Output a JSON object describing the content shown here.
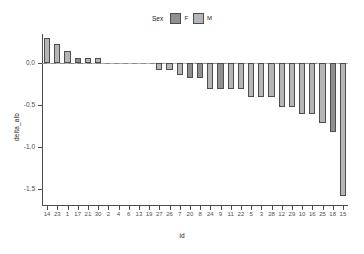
{
  "legend": {
    "title": "Sex",
    "items": [
      {
        "label": "F",
        "color": "#8f8f8f"
      },
      {
        "label": "M",
        "color": "#b5b5b5"
      }
    ]
  },
  "axes": {
    "x_title": "id",
    "y_title": "delta_alb",
    "y_ticks": [
      "0.0",
      "-0.5",
      "-1.0",
      "-1.5"
    ]
  },
  "chart_data": {
    "type": "bar",
    "title": "",
    "xlabel": "id",
    "ylabel": "delta_alb",
    "ylim": [
      -1.7,
      0.35
    ],
    "grid": false,
    "legend_position": "top",
    "legend_title": "Sex",
    "categories": [
      "14",
      "23",
      "1",
      "17",
      "21",
      "30",
      "2",
      "4",
      "6",
      "13",
      "19",
      "27",
      "26",
      "7",
      "20",
      "8",
      "24",
      "9",
      "11",
      "22",
      "5",
      "3",
      "28",
      "12",
      "29",
      "10",
      "16",
      "25",
      "18",
      "15"
    ],
    "values": [
      0.3,
      0.23,
      0.15,
      0.06,
      0.06,
      0.06,
      0.0,
      0.0,
      0.0,
      0.0,
      0.0,
      -0.08,
      -0.08,
      -0.14,
      -0.17,
      -0.18,
      -0.3,
      -0.3,
      -0.3,
      -0.3,
      -0.4,
      -0.4,
      -0.4,
      -0.52,
      -0.52,
      -0.6,
      -0.6,
      -0.71,
      -0.82,
      -1.58
    ],
    "groups": [
      "M",
      "M",
      "M",
      "F",
      "M",
      "M",
      "",
      "",
      "",
      "",
      "",
      "M",
      "M",
      "M",
      "F",
      "F",
      "M",
      "F",
      "M",
      "M",
      "M",
      "M",
      "M",
      "M",
      "M",
      "M",
      "M",
      "M",
      "F",
      "M"
    ],
    "series": [
      {
        "name": "F",
        "color": "#8f8f8f",
        "points": [
          {
            "id": "17",
            "value": 0.06
          },
          {
            "id": "20",
            "value": -0.17
          },
          {
            "id": "8",
            "value": -0.18
          },
          {
            "id": "9",
            "value": -0.3
          },
          {
            "id": "18",
            "value": -0.82
          }
        ]
      },
      {
        "name": "M",
        "color": "#b5b5b5",
        "points": [
          {
            "id": "14",
            "value": 0.3
          },
          {
            "id": "23",
            "value": 0.23
          },
          {
            "id": "1",
            "value": 0.15
          },
          {
            "id": "21",
            "value": 0.06
          },
          {
            "id": "30",
            "value": 0.06
          },
          {
            "id": "27",
            "value": -0.08
          },
          {
            "id": "26",
            "value": -0.08
          },
          {
            "id": "7",
            "value": -0.14
          },
          {
            "id": "24",
            "value": -0.3
          },
          {
            "id": "11",
            "value": -0.3
          },
          {
            "id": "22",
            "value": -0.3
          },
          {
            "id": "5",
            "value": -0.4
          },
          {
            "id": "3",
            "value": -0.4
          },
          {
            "id": "28",
            "value": -0.4
          },
          {
            "id": "12",
            "value": -0.52
          },
          {
            "id": "29",
            "value": -0.52
          },
          {
            "id": "10",
            "value": -0.6
          },
          {
            "id": "16",
            "value": -0.6
          },
          {
            "id": "25",
            "value": -0.71
          },
          {
            "id": "15",
            "value": -1.58
          }
        ]
      }
    ],
    "zero_ids": [
      "2",
      "4",
      "6",
      "13",
      "19"
    ]
  }
}
